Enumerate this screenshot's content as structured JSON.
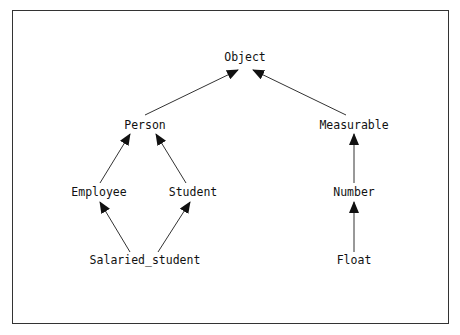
{
  "diagram": {
    "type": "inheritance-graph",
    "colors": {
      "stroke": "#333333",
      "text": "#111111",
      "background": "#ffffff"
    },
    "nodes": [
      {
        "id": "object",
        "label": "Object",
        "x": 245,
        "y": 58
      },
      {
        "id": "person",
        "label": "Person",
        "x": 145,
        "y": 126
      },
      {
        "id": "measurable",
        "label": "Measurable",
        "x": 354,
        "y": 126
      },
      {
        "id": "employee",
        "label": "Employee",
        "x": 99,
        "y": 193
      },
      {
        "id": "student",
        "label": "Student",
        "x": 193,
        "y": 193
      },
      {
        "id": "number",
        "label": "Number",
        "x": 354,
        "y": 193
      },
      {
        "id": "salaried_student",
        "label": "Salaried_student",
        "x": 145,
        "y": 261
      },
      {
        "id": "float",
        "label": "Float",
        "x": 354,
        "y": 261
      }
    ],
    "edges": [
      {
        "from": "person",
        "to": "object",
        "x1": 145,
        "y1": 115,
        "x2": 238,
        "y2": 70
      },
      {
        "from": "measurable",
        "to": "object",
        "x1": 346,
        "y1": 115,
        "x2": 253,
        "y2": 70
      },
      {
        "from": "employee",
        "to": "person",
        "x1": 100,
        "y1": 183,
        "x2": 130,
        "y2": 134
      },
      {
        "from": "student",
        "to": "person",
        "x1": 186,
        "y1": 183,
        "x2": 156,
        "y2": 134
      },
      {
        "from": "number",
        "to": "measurable",
        "x1": 354,
        "y1": 183,
        "x2": 354,
        "y2": 134
      },
      {
        "from": "salaried_student",
        "to": "employee",
        "x1": 130,
        "y1": 252,
        "x2": 100,
        "y2": 202
      },
      {
        "from": "salaried_student",
        "to": "student",
        "x1": 158,
        "y1": 252,
        "x2": 190,
        "y2": 202
      },
      {
        "from": "float",
        "to": "number",
        "x1": 354,
        "y1": 252,
        "x2": 354,
        "y2": 202
      }
    ]
  }
}
